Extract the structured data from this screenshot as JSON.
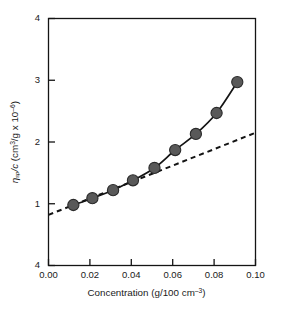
{
  "chart_data": {
    "type": "scatter",
    "title": "",
    "xlabel": "Concentration (g/100 cm⁻³)",
    "ylabel": "ηsp/c (cm³/g x 10⁻⁶)",
    "ylabel_parts": {
      "symbol": "η",
      "subscript": "sp",
      "divisor": "/c",
      "units_prefix": " (cm",
      "units_sup1": "3",
      "units_mid": "/g x 10",
      "units_sup2": "–6",
      "units_close": ")"
    },
    "xlabel_parts": {
      "text": "Concentration (g/100 cm",
      "sup": "–3",
      "close": ")"
    },
    "xlim": [
      0.0,
      0.1
    ],
    "ylim": [
      0.0,
      4.0
    ],
    "xticks": [
      0.0,
      0.02,
      0.04,
      0.06,
      0.08,
      0.1
    ],
    "xtick_labels": [
      "0.00",
      "0.02",
      "0.04",
      "0.06",
      "0.08",
      "0.10"
    ],
    "yticks": [
      0.0,
      1.0,
      2.0,
      3.0,
      4.0
    ],
    "ytick_labels": [
      "4",
      "1",
      "2",
      "3",
      "4"
    ],
    "ytick_label_bottom": "4",
    "ytick_label_top": "4",
    "grid": false,
    "legend": false,
    "frame": true,
    "marker_color": "#595959",
    "marker_edge_color": "#2b2b2b",
    "line_color": "#141414",
    "dashed_line_color": "#141414",
    "axis_color": "#141414",
    "background": "#ffffff",
    "marker_size": 5.6,
    "series": [
      {
        "name": "measured",
        "style": "solid-line-with-markers",
        "x": [
          0.012,
          0.0212,
          0.0312,
          0.0408,
          0.0512,
          0.0612,
          0.0712,
          0.0812,
          0.0912
        ],
        "y": [
          0.98,
          1.09,
          1.22,
          1.38,
          1.58,
          1.87,
          2.13,
          2.47,
          2.97
        ]
      },
      {
        "name": "extrapolated-linear-fit",
        "style": "dashed-line",
        "x": [
          0.0,
          0.1
        ],
        "y": [
          0.82,
          2.15
        ]
      }
    ]
  },
  "figure": {
    "width": 293,
    "height": 311
  }
}
